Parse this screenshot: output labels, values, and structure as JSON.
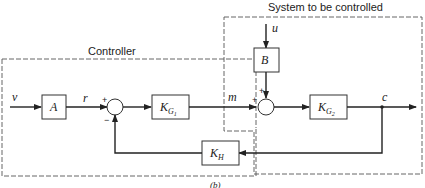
{
  "regions": {
    "controller": {
      "label": "Controller"
    },
    "plant": {
      "label": "System to be controlled"
    }
  },
  "signals": {
    "v": "v",
    "r": "r",
    "m": "m",
    "u": "u",
    "c": "c"
  },
  "blocks": {
    "A": {
      "label": "A"
    },
    "B": {
      "label": "B"
    },
    "KG1": {
      "label": "K",
      "sub": "G",
      "subsub": "1"
    },
    "KG2": {
      "label": "K",
      "sub": "G",
      "subsub": "2"
    },
    "KH": {
      "label": "K",
      "sub": "H"
    }
  },
  "summing_junctions": {
    "s1": {
      "plus": "+",
      "minus": "−"
    },
    "s2": {
      "plus_left": "+",
      "plus_top": "+"
    }
  },
  "caption": "(b)"
}
